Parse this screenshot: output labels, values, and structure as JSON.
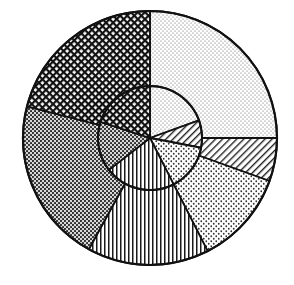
{
  "chart_data": {
    "type": "pie",
    "variant": "nested-pie (inner pie + outer ring), black & white hatch patterns",
    "title": "",
    "legend": [],
    "note": "No text, labels, or legend are visible in the image; values are approximate angular shares (%) estimated from segment geometry.",
    "center": [
      150,
      138
    ],
    "outer_radius": 127,
    "inner_radius": 52,
    "outer_ring": {
      "start_angle_deg_clockwise_from_top": 0,
      "segments": [
        {
          "pattern": "fine-dots-light",
          "share": 25.0
        },
        {
          "pattern": "diagonal-hatch",
          "share": 5.5
        },
        {
          "pattern": "medium-dots",
          "share": 12.0
        },
        {
          "pattern": "vertical-lines",
          "share": 15.5
        },
        {
          "pattern": "dense-dots",
          "share": 21.0
        },
        {
          "pattern": "crosshatch-dark",
          "share": 21.0
        }
      ]
    },
    "inner_pie": {
      "start_angle_deg_clockwise_from_top": 0,
      "segments": [
        {
          "pattern": "fine-dots-light",
          "share": 19.5
        },
        {
          "pattern": "diagonal-hatch",
          "share": 8.5
        },
        {
          "pattern": "medium-dots",
          "share": 14.5
        },
        {
          "pattern": "vertical-lines",
          "share": 22.0
        },
        {
          "pattern": "dense-dots",
          "share": 15.5
        },
        {
          "pattern": "crosshatch-dark",
          "share": 20.0
        }
      ]
    }
  },
  "colors": {
    "ink": "#111111",
    "paper": "#ffffff"
  }
}
